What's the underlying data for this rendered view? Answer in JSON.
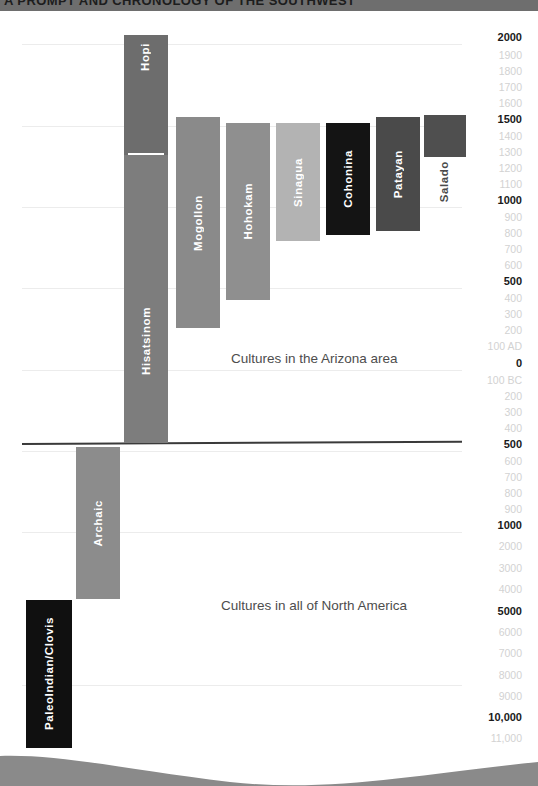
{
  "header": {
    "running_head": "A PROMPT AND CHRONOLOGY OF THE SOUTHWEST"
  },
  "captions": {
    "arizona": "Cultures in the Arizona area",
    "north_america": "Cultures in all of North America"
  },
  "colors": {
    "hopi": "#6d6d6d",
    "hisatsinom": "#7d7d7d",
    "mogollon": "#8a8a8a",
    "hohokam": "#8f8f8f",
    "sinagua": "#b3b3b3",
    "cohonina": "#141414",
    "patayan": "#4a4a4a",
    "salado": "#4f4f4f",
    "archaic": "#8c8c8c",
    "paleoindian": "#101010",
    "axis_major": "#1a1a1a",
    "axis_minor": "#d2d2d2",
    "gridline": "#ececec",
    "era_divider": "#3a3a3a",
    "wave": "#8a8a8a"
  },
  "chart_data": {
    "type": "bar",
    "orientation": "vertical-timeline",
    "xlabel": "",
    "ylabel": "Years (AD / BC)",
    "grid": true,
    "legend": "none",
    "axis_note": "Time runs downward: AD at top, BC increasing downward; scale compresses after 1000 BC",
    "axis_ticks": [
      {
        "label": "2000",
        "major": true,
        "y": 26
      },
      {
        "label": "1900",
        "major": false,
        "y": 44
      },
      {
        "label": "1800",
        "major": false,
        "y": 60
      },
      {
        "label": "1700",
        "major": false,
        "y": 76
      },
      {
        "label": "1600",
        "major": false,
        "y": 92
      },
      {
        "label": "1500",
        "major": true,
        "y": 108
      },
      {
        "label": "1400",
        "major": false,
        "y": 125
      },
      {
        "label": "1300",
        "major": false,
        "y": 141
      },
      {
        "label": "1200",
        "major": false,
        "y": 157
      },
      {
        "label": "1100",
        "major": false,
        "y": 173
      },
      {
        "label": "1000",
        "major": true,
        "y": 189
      },
      {
        "label": "900",
        "major": false,
        "y": 206
      },
      {
        "label": "800",
        "major": false,
        "y": 222
      },
      {
        "label": "700",
        "major": false,
        "y": 238
      },
      {
        "label": "600",
        "major": false,
        "y": 254
      },
      {
        "label": "500",
        "major": true,
        "y": 270
      },
      {
        "label": "400",
        "major": false,
        "y": 287
      },
      {
        "label": "300",
        "major": false,
        "y": 303
      },
      {
        "label": "200",
        "major": false,
        "y": 319
      },
      {
        "label": "100 AD",
        "major": false,
        "y": 335
      },
      {
        "label": "0",
        "major": true,
        "y": 352
      },
      {
        "label": "100 BC",
        "major": false,
        "y": 369
      },
      {
        "label": "200",
        "major": false,
        "y": 385
      },
      {
        "label": "300",
        "major": false,
        "y": 401
      },
      {
        "label": "400",
        "major": false,
        "y": 417
      },
      {
        "label": "500",
        "major": true,
        "y": 433
      },
      {
        "label": "600",
        "major": false,
        "y": 450
      },
      {
        "label": "700",
        "major": false,
        "y": 466
      },
      {
        "label": "800",
        "major": false,
        "y": 482
      },
      {
        "label": "900",
        "major": false,
        "y": 498
      },
      {
        "label": "1000",
        "major": true,
        "y": 514
      },
      {
        "label": "2000",
        "major": false,
        "y": 552
      },
      {
        "label": "3000",
        "major": false,
        "y": 591
      },
      {
        "label": "4000",
        "major": false,
        "y": 629
      },
      {
        "label": "5000",
        "major": true,
        "y": 667
      },
      {
        "label": "6000",
        "major": false,
        "y": 705
      },
      {
        "label": "7000",
        "major": false,
        "y": 743
      },
      {
        "label": "8000",
        "major": false,
        "y": 781
      },
      {
        "label": "9000",
        "major": false,
        "y": 819
      },
      {
        "label": "10,000",
        "major": true,
        "y": 857
      },
      {
        "label": "11,000",
        "major": false,
        "y": 895
      }
    ],
    "gridlines_y": [
      33,
      115,
      196,
      277,
      359,
      440,
      521,
      674,
      826
    ],
    "series": [
      {
        "name": "Hopi",
        "group": "arizona",
        "start_label": "2000",
        "end_label": "1250",
        "color": "#6d6d6d",
        "label_position": "upper"
      },
      {
        "name": "Hisatsinom",
        "group": "arizona",
        "start_label": "1250",
        "end_label": "1000 BC",
        "color": "#7d7d7d",
        "label_position": "lower"
      },
      {
        "name": "Mogollon",
        "group": "arizona",
        "start_label": "1450",
        "end_label": "200 AD",
        "color": "#8a8a8a",
        "label_position": "middle"
      },
      {
        "name": "Hohokam",
        "group": "arizona",
        "start_label": "1400",
        "end_label": "300 AD",
        "color": "#8f8f8f",
        "label_position": "middle"
      },
      {
        "name": "Sinagua",
        "group": "arizona",
        "start_label": "1400",
        "end_label": "650",
        "color": "#b3b3b3",
        "label_position": "middle"
      },
      {
        "name": "Cohonina",
        "group": "arizona",
        "start_label": "1300",
        "end_label": "600",
        "color": "#141414",
        "label_position": "middle"
      },
      {
        "name": "Patayan",
        "group": "arizona",
        "start_label": "1350",
        "end_label": "700",
        "color": "#4a4a4a",
        "label_position": "middle"
      },
      {
        "name": "Salado",
        "group": "arizona",
        "start_label": "1450",
        "end_label": "1150",
        "color": "#4f4f4f",
        "label_position": "below"
      },
      {
        "name": "Archaic",
        "group": "north_america",
        "start_label": "1000 BC",
        "end_label": "6000 BC",
        "color": "#8c8c8c",
        "label_position": "middle"
      },
      {
        "name": "PaleoIndian/Clovis",
        "group": "north_america",
        "start_label": "6500 BC",
        "end_label": "11,000 BC",
        "color": "#101010",
        "label_position": "middle"
      }
    ]
  }
}
